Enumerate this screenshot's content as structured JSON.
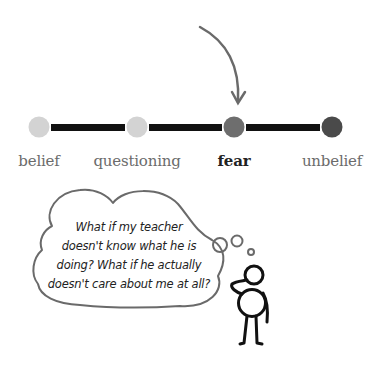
{
  "timeline": {
    "stages": [
      {
        "label": "belief",
        "x": 39,
        "color": "#d3d3d3",
        "active": false
      },
      {
        "label": "questioning",
        "x": 137,
        "color": "#d3d3d3",
        "active": false
      },
      {
        "label": "fear",
        "x": 234,
        "color": "#6e6e6e",
        "active": true
      },
      {
        "label": "unbelief",
        "x": 332,
        "color": "#4a4a4a",
        "active": false
      }
    ],
    "connector_color": "#111111",
    "arrow_color": "#6a6a6a"
  },
  "thought_bubble": {
    "lines": [
      "What if my teacher",
      "doesn't know what he is",
      "doing? What if he actually",
      "doesn't care about me at all?"
    ]
  },
  "figure": {
    "pose": "thinking"
  }
}
